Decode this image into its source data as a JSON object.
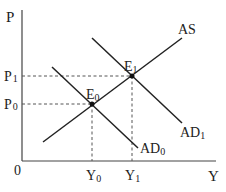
{
  "diagram": {
    "type": "AS-AD model",
    "axes": {
      "y_label": "P",
      "x_label": "Y",
      "origin_label": "0"
    },
    "curves": [
      {
        "id": "AS",
        "label": "AS"
      },
      {
        "id": "AD0",
        "label": "AD",
        "subscript": "0"
      },
      {
        "id": "AD1",
        "label": "AD",
        "subscript": "1"
      }
    ],
    "equilibria": [
      {
        "id": "E0",
        "label": "E",
        "subscript": "0",
        "price": "P",
        "price_sub": "0",
        "output": "Y",
        "output_sub": "0"
      },
      {
        "id": "E1",
        "label": "E",
        "subscript": "1",
        "price": "P",
        "price_sub": "1",
        "output": "Y",
        "output_sub": "1"
      }
    ],
    "colors": {
      "line": "#222222",
      "guide": "#555555"
    }
  }
}
